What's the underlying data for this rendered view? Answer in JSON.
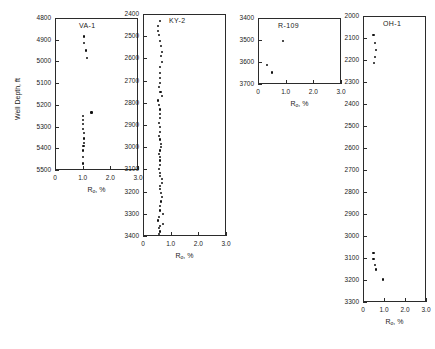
{
  "figure": {
    "y_axis_title": "Well Depth, ft",
    "x_axis_title_main": "R",
    "x_axis_title_sub": "o",
    "x_axis_title_tail": ", %"
  },
  "chart_data": [
    {
      "type": "scatter",
      "title": "VA-1",
      "xlabel": "Ro, %",
      "ylabel": "Well Depth, ft",
      "xlim": [
        0,
        3.0
      ],
      "ylim": [
        4800,
        5500
      ],
      "y_inverted": true,
      "grid": false,
      "legend": "none",
      "xticks": [
        "0",
        "1.0",
        "2.0",
        "3.0"
      ],
      "xtick_values": [
        0,
        1.0,
        2.0,
        3.0
      ],
      "yticks": [
        "4800",
        "4900",
        "5000",
        "5100",
        "5200",
        "5300",
        "5400",
        "5500"
      ],
      "ytick_values": [
        4800,
        4900,
        5000,
        5100,
        5200,
        5300,
        5400,
        5500
      ],
      "x": [
        1.05,
        1.05,
        1.12,
        1.15,
        1.32,
        1.02,
        1.0,
        1.0,
        1.02,
        1.05,
        1.04,
        1.05,
        1.03,
        1.02,
        1.0,
        1.0
      ],
      "y": [
        4885,
        4915,
        4950,
        4985,
        5235,
        5250,
        5270,
        5290,
        5310,
        5330,
        5355,
        5375,
        5390,
        5410,
        5440,
        5470
      ]
    },
    {
      "type": "scatter",
      "title": "KY-2",
      "xlabel": "Ro, %",
      "ylabel": "Well Depth, ft",
      "xlim": [
        0,
        3.0
      ],
      "ylim": [
        2400,
        3400
      ],
      "y_inverted": true,
      "grid": false,
      "legend": "none",
      "xticks": [
        "0",
        "1.0",
        "2.0",
        "3.0"
      ],
      "xtick_values": [
        0,
        1.0,
        2.0,
        3.0
      ],
      "yticks": [
        "2400",
        "2500",
        "2600",
        "2700",
        "2800",
        "2900",
        "3000",
        "3100",
        "3200",
        "3300",
        "3400"
      ],
      "ytick_values": [
        2400,
        2500,
        2600,
        2700,
        2800,
        2900,
        3000,
        3100,
        3200,
        3300,
        3400
      ],
      "x": [
        0.62,
        0.55,
        0.55,
        0.58,
        0.6,
        0.65,
        0.68,
        0.66,
        0.7,
        0.62,
        0.6,
        0.62,
        0.6,
        0.58,
        0.63,
        0.68,
        0.55,
        0.58,
        0.6,
        0.62,
        0.6,
        0.58,
        0.62,
        0.6,
        0.58,
        0.6,
        0.64,
        0.66,
        0.6,
        0.58,
        0.6,
        0.62,
        0.6,
        0.58,
        0.62,
        0.6,
        0.68,
        0.7,
        0.6,
        0.62,
        0.66,
        0.7,
        0.64,
        0.6,
        0.62,
        0.72,
        0.58,
        0.54,
        0.72,
        0.6,
        0.58,
        0.6,
        0.58
      ],
      "y": [
        2430,
        2455,
        2475,
        2495,
        2520,
        2545,
        2570,
        2590,
        2615,
        2640,
        2665,
        2690,
        2710,
        2730,
        2750,
        2770,
        2790,
        2810,
        2830,
        2850,
        2870,
        2890,
        2910,
        2930,
        2950,
        2965,
        2985,
        3000,
        3015,
        3030,
        3045,
        3060,
        3080,
        3100,
        3115,
        3130,
        3145,
        3160,
        3175,
        3190,
        3205,
        3225,
        3245,
        3265,
        3285,
        3300,
        3315,
        3330,
        3345,
        3355,
        3365,
        3380,
        3390
      ]
    },
    {
      "type": "scatter",
      "title": "R-109",
      "xlabel": "Ro, %",
      "ylabel": "Well Depth, ft",
      "xlim": [
        0,
        3.0
      ],
      "ylim": [
        3400,
        3700
      ],
      "y_inverted": true,
      "grid": false,
      "legend": "none",
      "xticks": [
        "0",
        "1.0",
        "2.0",
        "3.0"
      ],
      "xtick_values": [
        0,
        1.0,
        2.0,
        3.0
      ],
      "yticks": [
        "3400",
        "3500",
        "3600",
        "3700"
      ],
      "ytick_values": [
        3400,
        3500,
        3600,
        3700
      ],
      "x": [
        0.9,
        0.33,
        0.52
      ],
      "y": [
        3503,
        3613,
        3648
      ]
    },
    {
      "type": "scatter",
      "title": "OH-1",
      "xlabel": "Ro, %",
      "ylabel": "Well Depth, ft",
      "xlim": [
        0,
        3.0
      ],
      "ylim": [
        2000,
        3300
      ],
      "y_inverted": true,
      "grid": false,
      "legend": "none",
      "xticks": [
        "0",
        "1.0",
        "2.0",
        "3.0"
      ],
      "xtick_values": [
        0,
        1.0,
        2.0,
        3.0
      ],
      "yticks": [
        "2000",
        "2100",
        "2200",
        "2300",
        "2400",
        "2500",
        "2600",
        "2700",
        "2800",
        "2900",
        "3000",
        "3100",
        "3200",
        "3300"
      ],
      "ytick_values": [
        2000,
        2100,
        2200,
        2300,
        2400,
        2500,
        2600,
        2700,
        2800,
        2900,
        3000,
        3100,
        3200,
        3300
      ],
      "x": [
        0.5,
        0.56,
        0.62,
        0.58,
        0.52,
        0.5,
        0.5,
        0.58,
        0.62,
        0.95
      ],
      "y": [
        2085,
        2122,
        2155,
        2185,
        2215,
        3078,
        3105,
        3130,
        3152,
        3198
      ]
    }
  ]
}
